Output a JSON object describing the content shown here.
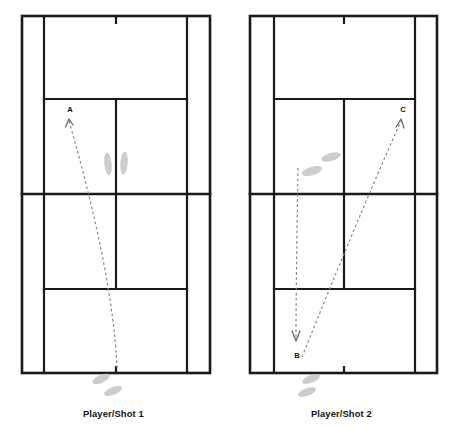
{
  "figure": {
    "type": "tennis-shot-diagram",
    "background_color": "#ffffff",
    "line_color": "#1a1a1a",
    "trajectory_color": "#8a8078",
    "footprint_color": "#c9c9c9"
  },
  "panels": [
    {
      "id": "left",
      "caption": "Player/Shot 1",
      "court": {
        "doubles_left": 22,
        "singles_left": 44,
        "center_service_line": 116,
        "singles_right": 187,
        "doubles_right": 210,
        "baseline_top": 16,
        "service_line_top": 99,
        "net_line": 194,
        "service_line_bottom": 289,
        "baseline_bottom": 373
      },
      "labels": [
        {
          "text": "A",
          "x": 70,
          "y": 112
        }
      ],
      "shots": [
        {
          "name": "shot-1",
          "from": "baseline",
          "to": "A",
          "start_x": 117,
          "start_y": 368,
          "end_x": 69,
          "end_y": 119,
          "arrow_at": "end"
        }
      ],
      "footprints": [
        {
          "name": "net-foot-left",
          "cx": 108,
          "cy": 164,
          "rx": 3.7,
          "ry": 11.5,
          "rot": -6
        },
        {
          "name": "net-foot-right",
          "cx": 124,
          "cy": 163,
          "rx": 3.7,
          "ry": 11.5,
          "rot": 4
        },
        {
          "name": "baseline-foot-upper",
          "cx": 101,
          "cy": 379,
          "rx": 9.5,
          "ry": 3.8,
          "rot": -24
        },
        {
          "name": "baseline-foot-lower",
          "cx": 113,
          "cy": 391,
          "rx": 9.5,
          "ry": 3.8,
          "rot": -22
        }
      ]
    },
    {
      "id": "right",
      "caption": "Player/Shot 2",
      "court": {
        "doubles_left": 250,
        "singles_left": 274,
        "center_service_line": 344,
        "singles_right": 415,
        "doubles_right": 437,
        "baseline_top": 16,
        "service_line_top": 99,
        "net_line": 194,
        "service_line_bottom": 289,
        "baseline_bottom": 373
      },
      "labels": [
        {
          "text": "C",
          "x": 403,
          "y": 112
        },
        {
          "text": "B",
          "x": 297,
          "y": 356
        }
      ],
      "shots": [
        {
          "name": "shot-2-incoming",
          "from": "net-area",
          "to": "B",
          "start_x": 298,
          "start_y": 168,
          "end_x": 296,
          "end_y": 340,
          "arrow_at": "end"
        },
        {
          "name": "shot-2-outgoing",
          "from": "B",
          "to": "C",
          "start_x": 302,
          "start_y": 356,
          "end_x": 402,
          "end_y": 119,
          "arrow_at": "end"
        }
      ],
      "footprints": [
        {
          "name": "net-foot-upper",
          "cx": 331,
          "cy": 157,
          "rx": 10,
          "ry": 4.0,
          "rot": -16
        },
        {
          "name": "net-foot-lower",
          "cx": 312,
          "cy": 171,
          "rx": 10.5,
          "ry": 4.2,
          "rot": -16
        },
        {
          "name": "baseline-foot-upper",
          "cx": 311,
          "cy": 379,
          "rx": 9.5,
          "ry": 3.8,
          "rot": -22
        },
        {
          "name": "baseline-foot-lower",
          "cx": 307,
          "cy": 392,
          "rx": 9.5,
          "ry": 3.8,
          "rot": -20
        }
      ]
    }
  ]
}
